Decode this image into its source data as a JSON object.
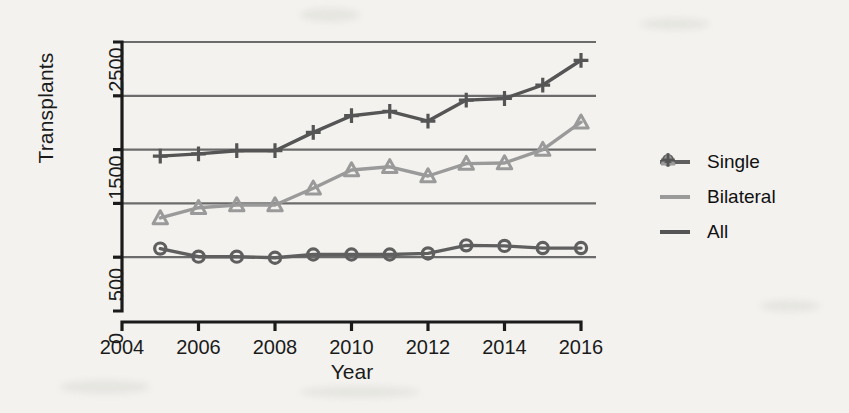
{
  "chart_data": {
    "type": "line",
    "title": "",
    "xlabel": "Year",
    "ylabel": "Transplants",
    "x": [
      2005,
      2006,
      2007,
      2008,
      2009,
      2010,
      2011,
      2012,
      2013,
      2014,
      2015,
      2016
    ],
    "xlim": [
      2004,
      2016
    ],
    "ylim": [
      0,
      2500
    ],
    "xticks": [
      2004,
      2006,
      2008,
      2010,
      2012,
      2014,
      2016
    ],
    "xtick_labels": [
      "2004",
      "2006",
      "2008",
      "2010",
      "2012",
      "2014",
      "2016"
    ],
    "yticks": [
      0,
      500,
      1000,
      1500,
      2000,
      2500
    ],
    "ytick_labels": [
      "0",
      "500",
      "",
      "1500",
      "",
      "2500"
    ],
    "grid": "horizontal",
    "legend_position": "right",
    "series": [
      {
        "name": "Single",
        "marker": "circle",
        "color": "#5f5f5f",
        "values": [
          580,
          505,
          505,
          495,
          525,
          525,
          525,
          535,
          610,
          605,
          585,
          585
        ]
      },
      {
        "name": "Bilateral",
        "marker": "triangle",
        "color": "#9a9a9a",
        "values": [
          865,
          960,
          985,
          985,
          1140,
          1310,
          1340,
          1255,
          1370,
          1375,
          1500,
          1755
        ]
      },
      {
        "name": "All",
        "marker": "plus",
        "color": "#555555",
        "values": [
          1440,
          1460,
          1490,
          1490,
          1660,
          1815,
          1855,
          1765,
          1960,
          1975,
          2100,
          2330
        ]
      }
    ]
  },
  "axes": {
    "y_title": "Transplants",
    "x_title": "Year"
  },
  "legend": {
    "items": [
      {
        "label": "Single",
        "marker": "circle-icon",
        "color": "#5f5f5f"
      },
      {
        "label": "Bilateral",
        "marker": "triangle-icon",
        "color": "#9a9a9a"
      },
      {
        "label": "All",
        "marker": "plus-icon",
        "color": "#555555"
      }
    ]
  },
  "colors": {
    "background": "#f3f2ef",
    "axis": "#1b1b1b",
    "grid": "#6b6b6b",
    "single": "#5f5f5f",
    "bilateral": "#9a9a9a",
    "all": "#555555"
  }
}
